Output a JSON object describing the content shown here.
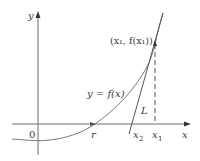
{
  "diagram": {
    "axes": {
      "x_label": "x",
      "y_label": "y",
      "origin_label": "0"
    },
    "curve": {
      "label": "y = f(x)"
    },
    "tangent_line": {
      "label": "L"
    },
    "points": {
      "root_label": "r",
      "x1_label": "x",
      "x1_sub": "1",
      "x2_label": "x",
      "x2_sub": "2",
      "tangent_point_label": "(x₁, f(x₁))"
    },
    "colors": {
      "axis": "#555555",
      "curve": "#6a6a6a",
      "tangent": "#555555",
      "dashed": "#555555",
      "text": "#3a3a3a"
    }
  }
}
